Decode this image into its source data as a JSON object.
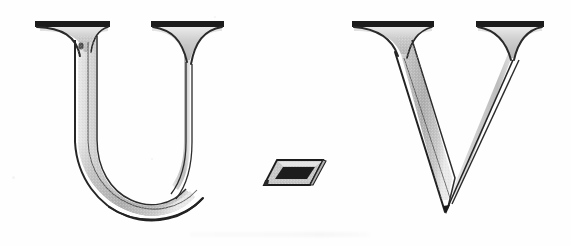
{
  "image": {
    "kind": "scanned-typography-specimen",
    "title": "U-V",
    "background_color": "#fefefe",
    "width_px": 571,
    "height_px": 246
  },
  "typography": {
    "style": "outlined inline serif (engraved / shaded display face)",
    "stroke_color": "#1a1a1a",
    "shade_color": "#b6b6b6",
    "shade_color_light": "#d4d4d4",
    "shade_color_dark": "#999999",
    "paper_color": "#fefefe"
  },
  "glyphs": [
    {
      "id": "glyph-u",
      "character": "U",
      "label": "letter-u",
      "bbox": {
        "x": 33,
        "y": 18,
        "width": 190,
        "height": 198
      }
    },
    {
      "id": "glyph-hyphen",
      "character": "-",
      "label": "hyphen",
      "bbox": {
        "x": 255,
        "y": 155,
        "width": 70,
        "height": 40
      }
    },
    {
      "id": "glyph-v",
      "character": "V",
      "label": "letter-v",
      "bbox": {
        "x": 352,
        "y": 18,
        "width": 190,
        "height": 196
      }
    }
  ],
  "artifacts": {
    "smudge_label": "faint-scan-smudge",
    "specks_label": "paper-specks"
  },
  "alt_text": "U-V"
}
